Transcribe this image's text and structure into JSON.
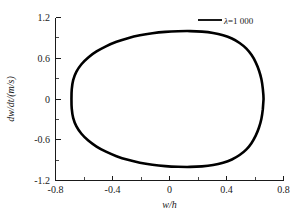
{
  "chart_data": {
    "type": "line",
    "title": "",
    "xlabel": "w/h",
    "ylabel": "dw/dt/(m/s)",
    "xlim": [
      -0.8,
      0.8
    ],
    "ylim": [
      -1.2,
      1.2
    ],
    "grid": false,
    "legend_position": "top-right",
    "x_ticks": [
      "-0.8",
      "-0.4",
      "0",
      "0.4",
      "0.8"
    ],
    "x_tick_values": [
      -0.8,
      -0.4,
      0,
      0.4,
      0.8
    ],
    "x_minor_tick_values": [
      -0.6,
      -0.2,
      0.2,
      0.6
    ],
    "y_ticks": [
      "1.2",
      "0.6",
      "0",
      "-0.6",
      "-1.2"
    ],
    "y_tick_values": [
      1.2,
      0.6,
      0,
      -0.6,
      -1.2
    ],
    "y_minor_tick_values": [
      0.9,
      0.3,
      -0.3,
      -0.9
    ],
    "series": [
      {
        "name": "λ=1 000",
        "color": "#000000",
        "closed": true,
        "comment": "closed phase-plane orbit (limit cycle)",
        "points": [
          [
            0.66,
            0.0
          ],
          [
            0.655,
            0.15
          ],
          [
            0.645,
            0.29
          ],
          [
            0.628,
            0.42
          ],
          [
            0.605,
            0.54
          ],
          [
            0.575,
            0.65
          ],
          [
            0.538,
            0.745
          ],
          [
            0.492,
            0.825
          ],
          [
            0.438,
            0.89
          ],
          [
            0.376,
            0.938
          ],
          [
            0.306,
            0.972
          ],
          [
            0.228,
            0.992
          ],
          [
            0.145,
            1.0
          ],
          [
            0.06,
            0.998
          ],
          [
            -0.03,
            0.988
          ],
          [
            -0.12,
            0.968
          ],
          [
            -0.208,
            0.938
          ],
          [
            -0.292,
            0.896
          ],
          [
            -0.372,
            0.842
          ],
          [
            -0.446,
            0.776
          ],
          [
            -0.512,
            0.7
          ],
          [
            -0.57,
            0.612
          ],
          [
            -0.618,
            0.512
          ],
          [
            -0.654,
            0.4
          ],
          [
            -0.676,
            0.278
          ],
          [
            -0.686,
            0.142
          ],
          [
            -0.688,
            0.0
          ],
          [
            -0.686,
            -0.142
          ],
          [
            -0.676,
            -0.278
          ],
          [
            -0.654,
            -0.4
          ],
          [
            -0.618,
            -0.512
          ],
          [
            -0.57,
            -0.612
          ],
          [
            -0.512,
            -0.7
          ],
          [
            -0.446,
            -0.776
          ],
          [
            -0.372,
            -0.842
          ],
          [
            -0.292,
            -0.896
          ],
          [
            -0.208,
            -0.938
          ],
          [
            -0.12,
            -0.968
          ],
          [
            -0.03,
            -0.988
          ],
          [
            0.06,
            -0.998
          ],
          [
            0.145,
            -1.0
          ],
          [
            0.228,
            -0.992
          ],
          [
            0.306,
            -0.972
          ],
          [
            0.376,
            -0.938
          ],
          [
            0.438,
            -0.89
          ],
          [
            0.492,
            -0.825
          ],
          [
            0.538,
            -0.745
          ],
          [
            0.575,
            -0.65
          ],
          [
            0.605,
            -0.54
          ],
          [
            0.628,
            -0.42
          ],
          [
            0.645,
            -0.29
          ],
          [
            0.655,
            -0.15
          ],
          [
            0.66,
            0.0
          ]
        ]
      }
    ],
    "legend": [
      {
        "label": "λ=1 000",
        "symbol_text": "λ",
        "value_text": "=1 000",
        "color": "#000000"
      }
    ]
  },
  "axes": {
    "x_title": "w/h",
    "y_title": "dw/dt/(m/s)"
  },
  "colors": {
    "curve": "#000000",
    "axis": "#1a1a1a",
    "background": "#ffffff"
  }
}
